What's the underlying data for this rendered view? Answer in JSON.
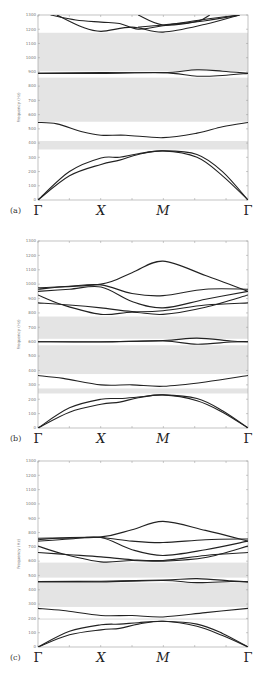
{
  "figure": {
    "panels": [
      {
        "tag": "(a)"
      },
      {
        "tag": "(b)"
      },
      {
        "tag": "(c)"
      }
    ],
    "x_labels": [
      "Γ",
      "X",
      "M",
      "Γ"
    ],
    "y_label": "Frequency (Hz)",
    "y_ticks": [
      "0",
      "100",
      "200",
      "300",
      "400",
      "500",
      "600",
      "700",
      "800",
      "900",
      "1000",
      "1100",
      "1200",
      "1300"
    ]
  },
  "chart_data": [
    {
      "type": "line",
      "title": "(a)",
      "xlabel": "",
      "ylabel": "Frequency (Hz)",
      "x_ticks": [
        "Γ",
        "X",
        "M",
        "Γ"
      ],
      "ylim": [
        0,
        1300
      ],
      "grid": false,
      "band_gaps": [
        [
          355,
          415
        ],
        [
          550,
          860
        ],
        [
          905,
          1175
        ]
      ],
      "series": [
        {
          "name": "acoustic-1",
          "points": [
            [
              0,
              0
            ],
            [
              0.5,
              170
            ],
            [
              1,
              250
            ],
            [
              1.3,
              280
            ],
            [
              1.6,
              320
            ],
            [
              2,
              345
            ],
            [
              2.4,
              300
            ],
            [
              2.7,
              170
            ],
            [
              3,
              0
            ]
          ]
        },
        {
          "name": "acoustic-2",
          "points": [
            [
              0,
              0
            ],
            [
              0.5,
              200
            ],
            [
              1,
              295
            ],
            [
              1.3,
              300
            ],
            [
              1.6,
              325
            ],
            [
              2,
              345
            ],
            [
              2.4,
              320
            ],
            [
              2.7,
              200
            ],
            [
              3,
              0
            ]
          ]
        },
        {
          "name": "optical-1",
          "points": [
            [
              0,
              545
            ],
            [
              0.3,
              535
            ],
            [
              0.7,
              480
            ],
            [
              1,
              455
            ],
            [
              1.4,
              455
            ],
            [
              2,
              438
            ],
            [
              2.4,
              470
            ],
            [
              2.7,
              515
            ],
            [
              3,
              545
            ]
          ]
        },
        {
          "name": "flat-1",
          "points": [
            [
              0,
              890
            ],
            [
              1,
              890
            ],
            [
              2,
              895
            ],
            [
              2.4,
              870
            ],
            [
              2.7,
              875
            ],
            [
              3,
              890
            ]
          ]
        },
        {
          "name": "flat-2",
          "points": [
            [
              0,
              890
            ],
            [
              1,
              895
            ],
            [
              2,
              895
            ],
            [
              2.4,
              915
            ],
            [
              2.7,
              905
            ],
            [
              3,
              890
            ]
          ]
        },
        {
          "name": "upper-1",
          "points": [
            [
              0.3,
              1300
            ],
            [
              0.7,
              1215
            ],
            [
              1,
              1185
            ],
            [
              1.5,
              1215
            ],
            [
              2,
              1180
            ],
            [
              2.5,
              1235
            ],
            [
              2.9,
              1300
            ]
          ]
        },
        {
          "name": "upper-2",
          "points": [
            [
              0.2,
              1300
            ],
            [
              0.6,
              1265
            ],
            [
              1,
              1250
            ],
            [
              1.3,
              1240
            ],
            [
              1.6,
              1200
            ],
            [
              2,
              1225
            ],
            [
              2.5,
              1270
            ],
            [
              2.9,
              1300
            ]
          ]
        },
        {
          "name": "upper-3",
          "points": [
            [
              1.6,
              1300
            ],
            [
              2,
              1230
            ],
            [
              2.4,
              1255
            ],
            [
              2.55,
              1300
            ]
          ]
        },
        {
          "name": "upper-4",
          "points": [
            [
              1.6,
              1215
            ],
            [
              2,
              1230
            ],
            [
              2.5,
              1260
            ],
            [
              2.9,
              1300
            ]
          ]
        }
      ]
    },
    {
      "type": "line",
      "title": "(b)",
      "xlabel": "",
      "ylabel": "Frequency (Hz)",
      "x_ticks": [
        "Γ",
        "X",
        "M",
        "Γ"
      ],
      "ylim": [
        0,
        1300
      ],
      "grid": false,
      "band_gaps": [
        [
          240,
          275
        ],
        [
          375,
          575
        ],
        [
          620,
          775
        ]
      ],
      "series": [
        {
          "name": "acoustic-1",
          "points": [
            [
              0,
              0
            ],
            [
              0.5,
              110
            ],
            [
              1,
              165
            ],
            [
              1.3,
              180
            ],
            [
              1.6,
              210
            ],
            [
              2,
              230
            ],
            [
              2.4,
              190
            ],
            [
              2.7,
              110
            ],
            [
              3,
              0
            ]
          ]
        },
        {
          "name": "acoustic-2",
          "points": [
            [
              0,
              0
            ],
            [
              0.5,
              140
            ],
            [
              1,
              200
            ],
            [
              1.3,
              205
            ],
            [
              1.6,
              215
            ],
            [
              2,
              230
            ],
            [
              2.4,
              205
            ],
            [
              2.7,
              120
            ],
            [
              3,
              0
            ]
          ]
        },
        {
          "name": "optical-1",
          "points": [
            [
              0,
              365
            ],
            [
              0.4,
              345
            ],
            [
              1,
              300
            ],
            [
              1.5,
              300
            ],
            [
              2,
              290
            ],
            [
              2.5,
              320
            ],
            [
              3,
              365
            ]
          ]
        },
        {
          "name": "flat-1",
          "points": [
            [
              0,
              600
            ],
            [
              1,
              598
            ],
            [
              2,
              605
            ],
            [
              2.4,
              582
            ],
            [
              2.8,
              598
            ],
            [
              3,
              600
            ]
          ]
        },
        {
          "name": "flat-2",
          "points": [
            [
              0,
              600
            ],
            [
              1,
              600
            ],
            [
              2,
              608
            ],
            [
              2.4,
              625
            ],
            [
              2.8,
              605
            ],
            [
              3,
              600
            ]
          ]
        },
        {
          "name": "upper-1",
          "points": [
            [
              0,
              870
            ],
            [
              0.5,
              855
            ],
            [
              1,
              835
            ],
            [
              1.5,
              810
            ],
            [
              2,
              815
            ],
            [
              2.5,
              855
            ],
            [
              3,
              870
            ]
          ]
        },
        {
          "name": "upper-2",
          "points": [
            [
              0,
              925
            ],
            [
              0.4,
              855
            ],
            [
              1,
              790
            ],
            [
              1.5,
              805
            ],
            [
              2,
              790
            ],
            [
              2.5,
              840
            ],
            [
              3,
              925
            ]
          ]
        },
        {
          "name": "upper-3",
          "points": [
            [
              0,
              950
            ],
            [
              0.5,
              965
            ],
            [
              1,
              980
            ],
            [
              1.5,
              880
            ],
            [
              2,
              835
            ],
            [
              2.5,
              895
            ],
            [
              3,
              950
            ]
          ]
        },
        {
          "name": "upper-4",
          "points": [
            [
              0,
              965
            ],
            [
              0.5,
              985
            ],
            [
              1,
              995
            ],
            [
              1.5,
              935
            ],
            [
              2,
              920
            ],
            [
              2.5,
              965
            ],
            [
              3,
              965
            ]
          ]
        },
        {
          "name": "upper-5",
          "points": [
            [
              0,
              975
            ],
            [
              1,
              1000
            ],
            [
              1.5,
              1080
            ],
            [
              2,
              1160
            ],
            [
              2.5,
              1060
            ],
            [
              3,
              950
            ]
          ]
        }
      ]
    },
    {
      "type": "line",
      "title": "(c)",
      "xlabel": "",
      "ylabel": "Frequency (Hz)",
      "x_ticks": [
        "Γ",
        "X",
        "M",
        "Γ"
      ],
      "ylim": [
        0,
        1300
      ],
      "grid": false,
      "band_gaps": [
        [
          190,
          200
        ],
        [
          280,
          450
        ],
        [
          485,
          590
        ]
      ],
      "series": [
        {
          "name": "acoustic-1",
          "points": [
            [
              0,
              0
            ],
            [
              0.5,
              85
            ],
            [
              1,
              120
            ],
            [
              1.3,
              130
            ],
            [
              1.6,
              160
            ],
            [
              2,
              180
            ],
            [
              2.4,
              145
            ],
            [
              2.7,
              80
            ],
            [
              3,
              0
            ]
          ]
        },
        {
          "name": "acoustic-2",
          "points": [
            [
              0,
              0
            ],
            [
              0.5,
              110
            ],
            [
              1,
              155
            ],
            [
              1.3,
              160
            ],
            [
              1.6,
              170
            ],
            [
              2,
              180
            ],
            [
              2.4,
              160
            ],
            [
              2.7,
              95
            ],
            [
              3,
              0
            ]
          ]
        },
        {
          "name": "optical-1",
          "points": [
            [
              0,
              270
            ],
            [
              0.4,
              255
            ],
            [
              1,
              220
            ],
            [
              1.5,
              220
            ],
            [
              2,
              210
            ],
            [
              2.5,
              240
            ],
            [
              3,
              270
            ]
          ]
        },
        {
          "name": "flat-1",
          "points": [
            [
              0,
              455
            ],
            [
              1,
              455
            ],
            [
              2,
              465
            ],
            [
              2.4,
              450
            ],
            [
              2.8,
              458
            ],
            [
              3,
              455
            ]
          ]
        },
        {
          "name": "flat-2",
          "points": [
            [
              0,
              458
            ],
            [
              1,
              460
            ],
            [
              2,
              468
            ],
            [
              2.4,
              478
            ],
            [
              2.8,
              462
            ],
            [
              3,
              455
            ]
          ]
        },
        {
          "name": "upper-1",
          "points": [
            [
              0,
              660
            ],
            [
              0.5,
              645
            ],
            [
              1,
              630
            ],
            [
              1.5,
              610
            ],
            [
              2,
              605
            ],
            [
              2.5,
              640
            ],
            [
              3,
              660
            ]
          ]
        },
        {
          "name": "upper-2",
          "points": [
            [
              0,
              705
            ],
            [
              0.4,
              650
            ],
            [
              1,
              595
            ],
            [
              1.5,
              605
            ],
            [
              2,
              600
            ],
            [
              2.5,
              625
            ],
            [
              3,
              705
            ]
          ]
        },
        {
          "name": "upper-3",
          "points": [
            [
              0,
              740
            ],
            [
              0.5,
              755
            ],
            [
              1,
              765
            ],
            [
              1.5,
              680
            ],
            [
              2,
              640
            ],
            [
              2.5,
              680
            ],
            [
              3,
              740
            ]
          ]
        },
        {
          "name": "upper-4",
          "points": [
            [
              0,
              750
            ],
            [
              0.5,
              765
            ],
            [
              1,
              765
            ],
            [
              1.5,
              740
            ],
            [
              2,
              730
            ],
            [
              2.5,
              750
            ],
            [
              3,
              755
            ]
          ]
        },
        {
          "name": "upper-5",
          "points": [
            [
              0,
              760
            ],
            [
              1,
              770
            ],
            [
              1.5,
              820
            ],
            [
              2,
              878
            ],
            [
              2.5,
              815
            ],
            [
              3,
              740
            ]
          ]
        }
      ]
    }
  ]
}
